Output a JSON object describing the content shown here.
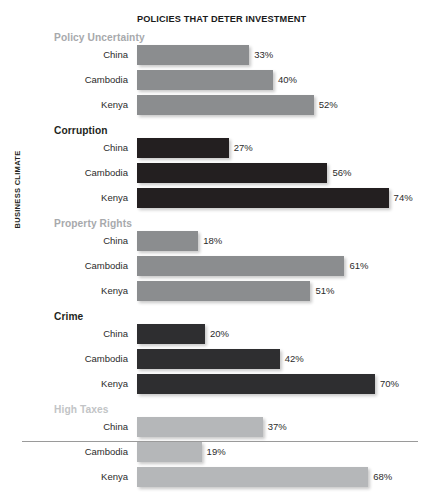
{
  "chart_data": {
    "type": "bar",
    "orientation": "horizontal",
    "title": "POLICIES THAT DETER INVESTMENT",
    "ylabel": "BUSINESS CLIMATE",
    "xlabel": "",
    "xlim": [
      0,
      80
    ],
    "grid": false,
    "legend": "none",
    "value_suffix": "%",
    "categories": [
      "China",
      "Cambodia",
      "Kenya"
    ],
    "groups": [
      {
        "name": "Policy Uncertainty",
        "title_color": "#a7a9ac",
        "bar_color": "#8b8d8f",
        "bars": [
          {
            "category": "China",
            "value": 33,
            "label": "33%"
          },
          {
            "category": "Cambodia",
            "value": 40,
            "label": "40%"
          },
          {
            "category": "Kenya",
            "value": 52,
            "label": "52%"
          }
        ]
      },
      {
        "name": "Corruption",
        "title_color": "#231f20",
        "bar_color": "#231f20",
        "bars": [
          {
            "category": "China",
            "value": 27,
            "label": "27%"
          },
          {
            "category": "Cambodia",
            "value": 56,
            "label": "56%"
          },
          {
            "category": "Kenya",
            "value": 74,
            "label": "74%"
          }
        ]
      },
      {
        "name": "Property Rights",
        "title_color": "#a7a9ac",
        "bar_color": "#8b8d8f",
        "bars": [
          {
            "category": "China",
            "value": 18,
            "label": "18%"
          },
          {
            "category": "Cambodia",
            "value": 61,
            "label": "61%"
          },
          {
            "category": "Kenya",
            "value": 51,
            "label": "51%"
          }
        ]
      },
      {
        "name": "Crime",
        "title_color": "#231f20",
        "bar_color": "#2e2e30",
        "bars": [
          {
            "category": "China",
            "value": 20,
            "label": "20%"
          },
          {
            "category": "Cambodia",
            "value": 42,
            "label": "42%"
          },
          {
            "category": "Kenya",
            "value": 70,
            "label": "70%"
          }
        ]
      },
      {
        "name": "High Taxes",
        "title_color": "#c2c4c6",
        "bar_color": "#b5b7b9",
        "bars": [
          {
            "category": "China",
            "value": 37,
            "label": "37%"
          },
          {
            "category": "Cambodia",
            "value": 19,
            "label": "19%"
          },
          {
            "category": "Kenya",
            "value": 68,
            "label": "68%"
          }
        ]
      }
    ]
  }
}
